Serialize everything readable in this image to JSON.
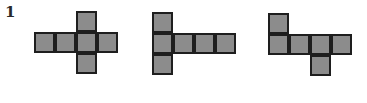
{
  "problem": {
    "number": "1",
    "cell_size": 21,
    "fill_color": "#8c8c8c",
    "border_color": "#1e1e1e",
    "nets": [
      {
        "name": "net-cross",
        "origin": [
          34,
          11
        ],
        "cells": [
          [
            2,
            0
          ],
          [
            0,
            1
          ],
          [
            1,
            1
          ],
          [
            2,
            1
          ],
          [
            3,
            1
          ],
          [
            2,
            2
          ]
        ]
      },
      {
        "name": "net-t-left",
        "origin": [
          152,
          12
        ],
        "cells": [
          [
            0,
            0
          ],
          [
            0,
            1
          ],
          [
            1,
            1
          ],
          [
            2,
            1
          ],
          [
            3,
            1
          ],
          [
            0,
            2
          ]
        ]
      },
      {
        "name": "net-step",
        "origin": [
          268,
          13
        ],
        "cells": [
          [
            0,
            0
          ],
          [
            0,
            1
          ],
          [
            1,
            1
          ],
          [
            2,
            1
          ],
          [
            3,
            1
          ],
          [
            2,
            2
          ]
        ]
      }
    ]
  }
}
